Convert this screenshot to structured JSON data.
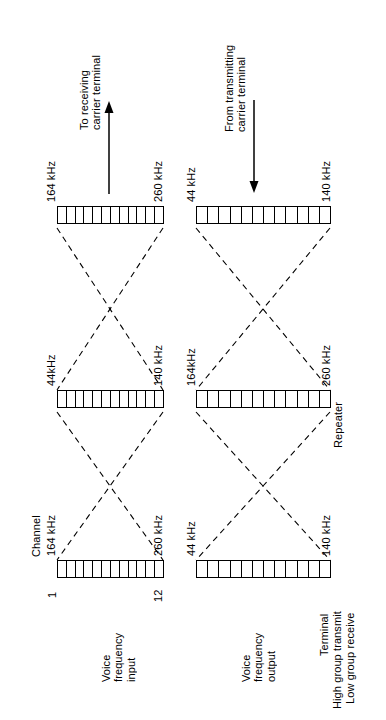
{
  "diagram": {
    "orientation": "rotated-90",
    "stroke_color": "#000000",
    "background": "#ffffff"
  },
  "labels": {
    "channel": "Channel",
    "channel_first": "1",
    "channel_last": "12",
    "repeater": "Repeater",
    "voice_frequency_input": "Voice\nfrequency\ninput",
    "voice_frequency_output": "Voice\nfrequency\noutput"
  },
  "arrows": [
    {
      "id": "to-receiving",
      "text": "To receiving\ncarrier terminal",
      "direction": "up"
    },
    {
      "id": "from-transmitting",
      "text": "From transmitting\ncarrier terminal",
      "direction": "down"
    }
  ],
  "legend": {
    "lines": [
      "Terminal",
      "High group transmit",
      "Low group receive"
    ]
  },
  "groups": [
    {
      "id": "terminal-high-transmit",
      "position": "top-left",
      "start_label": "164 kHz",
      "end_label": "260 kHz",
      "channels": 12
    },
    {
      "id": "terminal-low-receive",
      "position": "top-right",
      "start_label": "44 kHz",
      "end_label": "140 kHz",
      "channels": 12
    },
    {
      "id": "repeater-low",
      "position": "middle-left",
      "start_label": "44kHz",
      "end_label": "140 kHz",
      "channels": 12
    },
    {
      "id": "repeater-high",
      "position": "middle-right",
      "start_label": "164kHz",
      "end_label": "260 kHz",
      "channels": 12
    },
    {
      "id": "vf-input",
      "position": "bottom-left",
      "start_label": "164 kHz",
      "end_label": "260 kHz",
      "channels": 12
    },
    {
      "id": "vf-output",
      "position": "bottom-right",
      "start_label": "44 kHz",
      "end_label": "140 kHz",
      "channels": 12
    }
  ]
}
